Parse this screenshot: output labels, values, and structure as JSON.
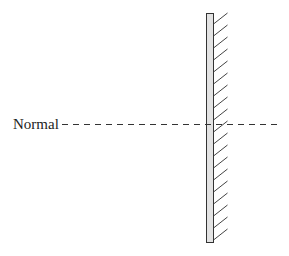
{
  "diagram": {
    "normal_label": "Normal",
    "colors": {
      "stroke": "#333333",
      "mirror_fill": "#e3e3e3",
      "background": "#ffffff"
    },
    "mirror": {
      "x": 206,
      "y": 13,
      "width": 7,
      "height": 229
    },
    "normal_line": {
      "y": 124,
      "x_start": 62,
      "x_end": 277,
      "dash": "6,5"
    },
    "hatch": {
      "count": 19,
      "spacing": 12,
      "dx": 14,
      "dy": 11,
      "first_y": 24
    }
  }
}
